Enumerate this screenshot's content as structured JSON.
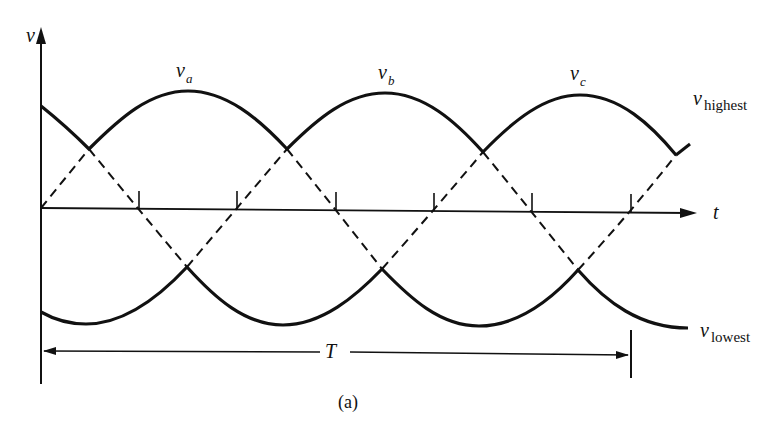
{
  "figure": {
    "caption": "(a)",
    "axes": {
      "y_label": "v",
      "x_label": "t"
    },
    "curves": {
      "va": {
        "label": "v",
        "subscript": "a"
      },
      "vb": {
        "label": "v",
        "subscript": "b"
      },
      "vc": {
        "label": "v",
        "subscript": "c"
      },
      "highest": {
        "label": "v",
        "subscript": "highest"
      },
      "lowest": {
        "label": "v",
        "subscript": "lowest"
      }
    },
    "period_label": "T",
    "tick_count": 6,
    "colors": {
      "ink": "#111111",
      "background": "#ffffff"
    }
  }
}
